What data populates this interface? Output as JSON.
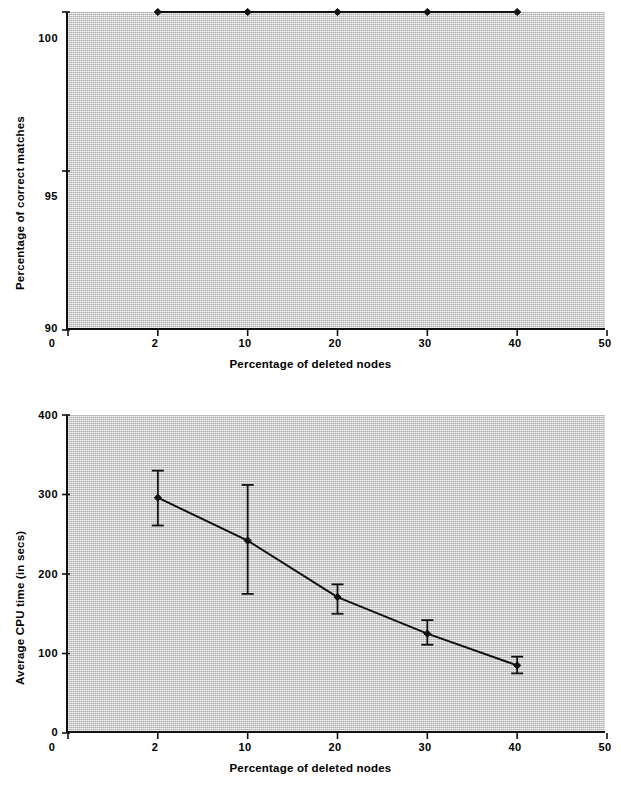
{
  "figure": {
    "background_color": "#ffffff",
    "plot_area_color": "#c9c9c9",
    "line_color": "#111111",
    "panels": 2
  },
  "chart_data": [
    {
      "id": "accuracy-panel",
      "type": "line",
      "title": "",
      "subtitle": "",
      "xlabel": "Percentage of deleted nodes",
      "ylabel": "Percentage of correct matches",
      "categories": [
        "0",
        "2",
        "10",
        "20",
        "30",
        "40",
        "50"
      ],
      "x": [
        2,
        10,
        20,
        30,
        40
      ],
      "values": [
        100,
        100,
        100,
        100,
        100
      ],
      "series": [
        {
          "name": "Percentage of correct matches",
          "values": [
            100,
            100,
            100,
            100,
            100
          ]
        }
      ],
      "xtick_labels": [
        "0",
        "2",
        "10",
        "20",
        "30",
        "40",
        "50"
      ],
      "ytick_labels": [
        "90",
        "95",
        "100"
      ],
      "ytick_values": [
        90,
        95,
        100
      ],
      "ylim": [
        90,
        100
      ],
      "grid": false,
      "legend": false,
      "marker": "filled-diamond",
      "error_bars": false
    },
    {
      "id": "cpu-time-panel",
      "type": "line",
      "title": "",
      "subtitle": "",
      "xlabel": "Percentage of deleted nodes",
      "ylabel": "Average CPU time (in secs)",
      "categories": [
        "0",
        "2",
        "10",
        "20",
        "30",
        "40",
        "50"
      ],
      "x": [
        2,
        10,
        20,
        30,
        40
      ],
      "values": [
        296,
        242,
        171,
        125,
        85
      ],
      "series": [
        {
          "name": "Average CPU time (in secs)",
          "values": [
            296,
            242,
            171,
            125,
            85
          ]
        }
      ],
      "error_bars": true,
      "error_upper": [
        330,
        312,
        187,
        142,
        96
      ],
      "error_lower": [
        261,
        175,
        150,
        111,
        75
      ],
      "xtick_labels": [
        "0",
        "2",
        "10",
        "20",
        "30",
        "40",
        "50"
      ],
      "ytick_labels": [
        "0",
        "100",
        "200",
        "300",
        "400"
      ],
      "ytick_values": [
        0,
        100,
        200,
        300,
        400
      ],
      "ylim": [
        0,
        400
      ],
      "grid": false,
      "legend": false,
      "marker": "filled-diamond"
    }
  ]
}
